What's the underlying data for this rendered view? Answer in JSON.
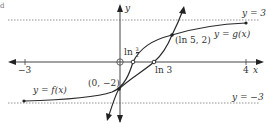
{
  "diagram": {
    "type": "function-graph",
    "corner_mark": "d",
    "axes": {
      "x_label": "x",
      "y_label": "y",
      "x_ticks": [
        {
          "value": -3,
          "label": "−3"
        },
        {
          "value": 4,
          "label": "4"
        }
      ],
      "origin_marker": "open-circle"
    },
    "asymptotes": [
      {
        "equation": "y = 3",
        "label": "y = 3",
        "style": "dotted"
      },
      {
        "equation": "y = −3",
        "label": "y = −3",
        "style": "dotted"
      }
    ],
    "curves": [
      {
        "name": "f",
        "label": "y = f(x)",
        "description": "increasing curve from left endpoint near y = −3 upward, steep, passing (0, −2), ln(3/2) on x-axis, and (ln 5, 2)"
      },
      {
        "name": "g",
        "label": "y = g(x)",
        "description": "steep increasing line-like curve passing (0, −2), ln 3 on x-axis and (ln 5, 2), approaching y = 3"
      }
    ],
    "points": [
      {
        "label": "(0, −2)",
        "x": 0,
        "y": -2
      },
      {
        "label": "(ln 5, 2)",
        "x": "ln 5",
        "y": 2
      }
    ],
    "x_intercepts": [
      {
        "label_main": "ln",
        "label_frac_num": "3",
        "label_frac_den": "2",
        "value": "ln(3/2)"
      },
      {
        "label": "ln 3",
        "value": "ln 3"
      }
    ],
    "labels": {
      "y_eq_3": "y = 3",
      "y_eq_neg3": "y = −3",
      "f_label": "y = f(x)",
      "g_label": "y = g(x)",
      "point_a": "(0, −2)",
      "point_b": "(ln 5, 2)",
      "ln3": "ln 3",
      "ln_frac_prefix": "ln",
      "frac_num": "3",
      "frac_den": "2",
      "x_axis": "x",
      "y_axis": "y",
      "tick_neg3": "−3",
      "tick_4": "4"
    },
    "colors": {
      "curve": "#2a2a2a",
      "axis": "#444444",
      "dotted": "#888888",
      "text": "#333333"
    }
  }
}
